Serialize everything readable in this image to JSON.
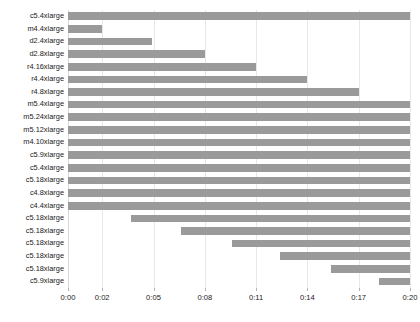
{
  "chart_data": {
    "type": "bar",
    "orientation": "horizontal",
    "subtype": "gantt",
    "title": "",
    "subtitle": "",
    "xlabel": "",
    "ylabel": "",
    "grid": true,
    "legend": null,
    "bar_color": "#9a9a9a",
    "grid_color": "#e8e8e8",
    "axis_color": "#d8d8d8",
    "text_color": "#1a1a1a",
    "xlim_minutes": [
      0,
      20
    ],
    "x_tick_labels": [
      "0:00",
      "0:02",
      "0:05",
      "0:08",
      "0:11",
      "0:14",
      "0:17",
      "0:20"
    ],
    "x_tick_values": [
      0,
      2,
      5,
      8,
      11,
      14,
      17,
      20
    ],
    "categories": [
      "c5.4xlarge",
      "m4.4xlarge",
      "d2.4xlarge",
      "d2.8xlarge",
      "r4.16xlarge",
      "r4.4xlarge",
      "r4.8xlarge",
      "m5.4xlarge",
      "m5.24xlarge",
      "m5.12xlarge",
      "m4.10xlarge",
      "c5.9xlarge",
      "c5.4xlarge",
      "c5.18xlarge",
      "c4.8xlarge",
      "c4.4xlarge",
      "c5.18xlarge",
      "c5.18xlarge",
      "c5.18xlarge",
      "c5.18xlarge",
      "c5.18xlarge",
      "c5.9xlarge"
    ],
    "bars": [
      {
        "category": "c5.4xlarge",
        "start": 0.0,
        "end": 20.0
      },
      {
        "category": "m4.4xlarge",
        "start": 0.0,
        "end": 2.0
      },
      {
        "category": "d2.4xlarge",
        "start": 0.0,
        "end": 4.9
      },
      {
        "category": "d2.8xlarge",
        "start": 0.0,
        "end": 8.0
      },
      {
        "category": "r4.16xlarge",
        "start": 0.0,
        "end": 11.0
      },
      {
        "category": "r4.4xlarge",
        "start": 0.0,
        "end": 14.0
      },
      {
        "category": "r4.8xlarge",
        "start": 0.0,
        "end": 17.0
      },
      {
        "category": "m5.4xlarge",
        "start": 0.0,
        "end": 20.0
      },
      {
        "category": "m5.24xlarge",
        "start": 0.0,
        "end": 20.0
      },
      {
        "category": "m5.12xlarge",
        "start": 0.0,
        "end": 20.0
      },
      {
        "category": "m4.10xlarge",
        "start": 0.0,
        "end": 20.0
      },
      {
        "category": "c5.9xlarge",
        "start": 0.0,
        "end": 20.0
      },
      {
        "category": "c5.4xlarge",
        "start": 0.0,
        "end": 20.0
      },
      {
        "category": "c5.18xlarge",
        "start": 0.0,
        "end": 20.0
      },
      {
        "category": "c4.8xlarge",
        "start": 0.0,
        "end": 20.0
      },
      {
        "category": "c4.4xlarge",
        "start": 0.0,
        "end": 20.0
      },
      {
        "category": "c5.18xlarge",
        "start": 3.7,
        "end": 20.0
      },
      {
        "category": "c5.18xlarge",
        "start": 6.6,
        "end": 20.0
      },
      {
        "category": "c5.18xlarge",
        "start": 9.6,
        "end": 20.0
      },
      {
        "category": "c5.18xlarge",
        "start": 12.4,
        "end": 20.0
      },
      {
        "category": "c5.18xlarge",
        "start": 15.4,
        "end": 20.0
      },
      {
        "category": "c5.9xlarge",
        "start": 18.2,
        "end": 20.0
      }
    ]
  }
}
